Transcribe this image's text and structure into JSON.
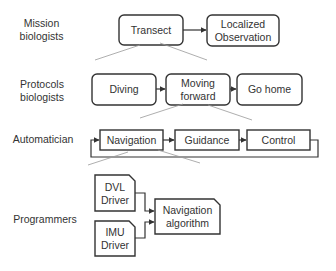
{
  "diagram": {
    "title": "",
    "roles": [
      {
        "id": "mission",
        "label": "Mission\nbiologists"
      },
      {
        "id": "protocols",
        "label": "Protocols\nbiologists"
      },
      {
        "id": "automatician",
        "label": "Automatician"
      },
      {
        "id": "programmers",
        "label": "Programmers"
      }
    ],
    "levels": {
      "mission": {
        "nodes": [
          {
            "id": "transect",
            "label": "Transect",
            "shape": "rounded-rect"
          },
          {
            "id": "localized_observation",
            "label": "Localized\nObservation",
            "shape": "rounded-rect"
          }
        ],
        "edges": [
          {
            "from": "transect",
            "to": "localized_observation"
          }
        ]
      },
      "protocols": {
        "nodes": [
          {
            "id": "diving",
            "label": "Diving",
            "shape": "rounded-rect"
          },
          {
            "id": "moving_forward",
            "label": "Moving\nforward",
            "shape": "rounded-rect"
          },
          {
            "id": "go_home",
            "label": "Go home",
            "shape": "rounded-rect"
          }
        ],
        "edges": [
          {
            "from": "diving",
            "to": "moving_forward"
          },
          {
            "from": "moving_forward",
            "to": "go_home"
          }
        ],
        "refines": "transect"
      },
      "automatician": {
        "nodes": [
          {
            "id": "navigation",
            "label": "Navigation",
            "shape": "rect"
          },
          {
            "id": "guidance",
            "label": "Guidance",
            "shape": "rect"
          },
          {
            "id": "control",
            "label": "Control",
            "shape": "rect"
          }
        ],
        "edges": [
          {
            "from": "navigation",
            "to": "guidance"
          },
          {
            "from": "guidance",
            "to": "control"
          },
          {
            "from": "control",
            "to": "navigation",
            "type": "feedback-loop"
          }
        ],
        "refines": "moving_forward"
      },
      "programmers": {
        "nodes": [
          {
            "id": "dvl_driver",
            "label": "DVL\nDriver",
            "shape": "folded-corner"
          },
          {
            "id": "imu_driver",
            "label": "IMU\nDriver",
            "shape": "folded-corner"
          },
          {
            "id": "navigation_algorithm",
            "label": "Navigation\nalgorithm",
            "shape": "folded-corner"
          }
        ],
        "edges": [
          {
            "from": "dvl_driver",
            "to": "navigation_algorithm"
          },
          {
            "from": "imu_driver",
            "to": "navigation_algorithm"
          }
        ],
        "refines": "navigation"
      }
    },
    "colors": {
      "stroke": "#333333",
      "text": "#333333",
      "refinement_line": "#999999",
      "background": "#ffffff"
    }
  }
}
